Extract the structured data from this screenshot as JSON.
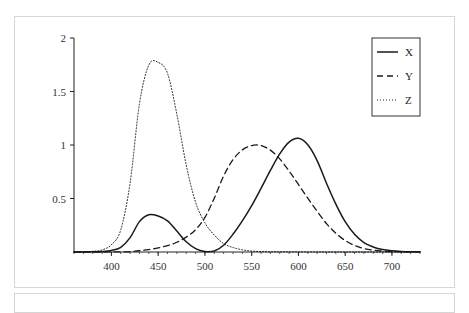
{
  "chart_data": {
    "type": "line",
    "title": "",
    "xlabel": "",
    "ylabel": "",
    "xlim": [
      360,
      730
    ],
    "ylim": [
      0,
      2
    ],
    "x_ticks": [
      400,
      450,
      500,
      550,
      600,
      650,
      700
    ],
    "x_tick_labels": [
      "400",
      "450",
      "500",
      "550",
      "600",
      "650",
      "700"
    ],
    "x_minor_step": 10,
    "y_ticks": [
      0.5,
      1,
      1.5,
      2
    ],
    "y_tick_labels": [
      "0.5",
      "1",
      "1.5",
      "2"
    ],
    "grid": false,
    "legend_position": "top-right",
    "x": [
      360,
      370,
      380,
      390,
      400,
      410,
      420,
      430,
      440,
      450,
      460,
      470,
      480,
      490,
      500,
      510,
      520,
      530,
      540,
      550,
      560,
      570,
      580,
      590,
      600,
      610,
      620,
      630,
      640,
      650,
      660,
      670,
      680,
      690,
      700,
      710,
      720,
      730
    ],
    "series": [
      {
        "name": "X",
        "style": "solid",
        "values": [
          0.0001,
          0.0004,
          0.0014,
          0.0042,
          0.0143,
          0.0435,
          0.1344,
          0.2839,
          0.3483,
          0.3362,
          0.2908,
          0.1954,
          0.0956,
          0.032,
          0.0049,
          0.0093,
          0.0633,
          0.1655,
          0.2904,
          0.4334,
          0.5945,
          0.7621,
          0.9163,
          1.0263,
          1.0622,
          1.0026,
          0.8544,
          0.6424,
          0.4479,
          0.2835,
          0.1649,
          0.0874,
          0.0468,
          0.0227,
          0.0114,
          0.0058,
          0.0029,
          0.0014
        ]
      },
      {
        "name": "Y",
        "style": "dashed",
        "values": [
          0.0,
          0.0,
          0.0,
          0.0001,
          0.0004,
          0.0012,
          0.004,
          0.0116,
          0.023,
          0.038,
          0.06,
          0.091,
          0.139,
          0.208,
          0.323,
          0.503,
          0.71,
          0.862,
          0.954,
          0.995,
          0.995,
          0.952,
          0.87,
          0.757,
          0.631,
          0.503,
          0.381,
          0.265,
          0.175,
          0.107,
          0.061,
          0.032,
          0.017,
          0.0082,
          0.0041,
          0.0021,
          0.001,
          0.0005
        ]
      },
      {
        "name": "Z",
        "style": "dotted",
        "values": [
          0.0006,
          0.0019,
          0.0065,
          0.0201,
          0.0679,
          0.2074,
          0.6456,
          1.3856,
          1.7471,
          1.7721,
          1.6692,
          1.2876,
          0.813,
          0.4652,
          0.272,
          0.1582,
          0.0782,
          0.0422,
          0.0203,
          0.0087,
          0.0039,
          0.0021,
          0.0017,
          0.0011,
          0.0008,
          0.0003,
          0.0002,
          0.0,
          0.0,
          0.0,
          0.0,
          0.0,
          0.0,
          0.0,
          0.0,
          0.0,
          0.0,
          0.0
        ]
      }
    ]
  }
}
